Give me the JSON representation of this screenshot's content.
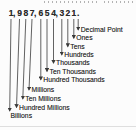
{
  "number": {
    "display": "1,987,654,321.",
    "tokens": [
      "1",
      ",",
      "9",
      "8",
      "7",
      ",",
      "6",
      "5",
      "4",
      ",",
      "3",
      "2",
      "1",
      "."
    ]
  },
  "places": [
    {
      "symbol": ".",
      "label": "Decimal Point"
    },
    {
      "symbol": "1",
      "label": "Ones"
    },
    {
      "symbol": "2",
      "label": "Tens"
    },
    {
      "symbol": "3",
      "label": "Hundreds"
    },
    {
      "symbol": "4",
      "label": "Thousands"
    },
    {
      "symbol": "5",
      "label": "Ten Thousands"
    },
    {
      "symbol": "6",
      "label": "Hundred Thousands"
    },
    {
      "symbol": "7",
      "label": "Millions"
    },
    {
      "symbol": "8",
      "label": "Ten Millions"
    },
    {
      "symbol": "9",
      "label": "Hundred Millions"
    },
    {
      "symbol": "1",
      "label": "Billions"
    }
  ],
  "colors": {
    "ink": "#2b2b2b",
    "arrow": "#3a3a3a",
    "remnant": "#9a9a9a",
    "divider": "#dedede"
  }
}
